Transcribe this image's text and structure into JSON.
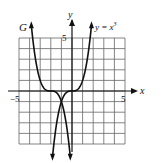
{
  "chart_data": {
    "type": "line",
    "title": "",
    "xlabel": "x",
    "ylabel": "y",
    "xlim": [
      -5,
      5
    ],
    "ylim": [
      -5,
      5
    ],
    "grid": true,
    "tick_labels": {
      "x": [
        "-5",
        "5"
      ],
      "y": [
        "5"
      ]
    },
    "series": [
      {
        "name": "y = x^3",
        "label": "y = x",
        "exponent": "3",
        "formula": "x^3"
      },
      {
        "name": "G",
        "label": "G",
        "formula": "-(x+2)^3"
      }
    ]
  },
  "labels": {
    "x_axis": "x",
    "y_axis": "y",
    "x_min": "−5",
    "x_max": "5",
    "y_max": "5",
    "curve_g": "G",
    "curve_cubic": "y = x",
    "curve_cubic_exp": "3"
  },
  "colors": {
    "grid": "#555555",
    "axis": "#111111",
    "curve": "#111111"
  }
}
